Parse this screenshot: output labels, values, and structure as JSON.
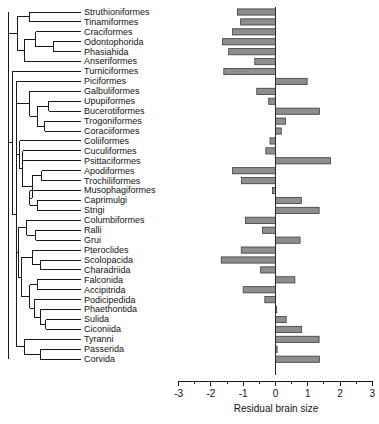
{
  "figure": {
    "kind": "phylogenetic-tree-with-bar-chart",
    "background": "#ffffff",
    "bar_fill": "#8e8e8e",
    "bar_stroke": "#3b3b3b",
    "branch_color": "#1a1a1a"
  },
  "chart_data": {
    "type": "bar",
    "orientation": "horizontal",
    "title": "",
    "xlabel": "Residual brain size",
    "ylabel": "",
    "xlim": [
      -3,
      3
    ],
    "xticks": [
      -3,
      -2,
      -1,
      0,
      1,
      2,
      3
    ],
    "xtick_labels": [
      "-3",
      "-2",
      "-1",
      "0",
      "1",
      "2",
      "3"
    ],
    "minor_ticks": true,
    "grid": false,
    "legend": null,
    "zero_reference_line": 0,
    "categories": [
      "Struthioniformes",
      "Tinamiformes",
      "Craciformes",
      "Odontophorida",
      "Phasiahida",
      "Anseriformes",
      "Turniciformes",
      "Piciformes",
      "Galbuliformes",
      "Upupiformes",
      "Bucerotiformes",
      "Trogoniformes",
      "Coraciiformes",
      "Coliiformes",
      "Cuculiformes",
      "Psittaciformes",
      "Apodiformes",
      "Trochiliformes",
      "Musophagiformes",
      "Caprimulgi",
      "Strigi",
      "Columbiformes",
      "Ralli",
      "Grui",
      "Pteroclides",
      "Scolopacida",
      "Charadriida",
      "Falconida",
      "Accipitrida",
      "Podicipedida",
      "Phaethontida",
      "Sulida",
      "Ciconiida",
      "Tyranni",
      "Passerida",
      "Corvida"
    ],
    "values": [
      -1.18,
      -1.08,
      -1.33,
      -1.64,
      -1.45,
      -0.64,
      -1.6,
      0.98,
      -0.58,
      -0.21,
      1.36,
      0.31,
      0.18,
      -0.17,
      -0.3,
      1.7,
      -1.33,
      -1.05,
      -0.09,
      0.8,
      -0.93,
      -0.4,
      0.76,
      -1.06,
      -1.68,
      -0.46,
      0.6,
      -1.0,
      -0.33,
      0.03,
      0.33,
      0.81,
      1.35,
      0.05,
      1.36,
      -1.3
    ],
    "n_taxa": 36
  },
  "taxa": [
    {
      "name": "Struthioniformes",
      "value": -1.18
    },
    {
      "name": "Tinamiformes",
      "value": -1.08
    },
    {
      "name": "Craciformes",
      "value": -1.33
    },
    {
      "name": "Odontophorida",
      "value": -1.64
    },
    {
      "name": "Phasiahida",
      "value": -1.45
    },
    {
      "name": "Anseriformes",
      "value": -0.64
    },
    {
      "name": "Turniciformes",
      "value": -1.6
    },
    {
      "name": "Piciformes",
      "value": 0.98
    },
    {
      "name": "Galbuliformes",
      "value": -0.58
    },
    {
      "name": "Upupiformes",
      "value": -0.21
    },
    {
      "name": "Bucerotiformes",
      "value": 1.36
    },
    {
      "name": "Trogoniformes",
      "value": 0.31
    },
    {
      "name": "Coraciiformes",
      "value": 0.18
    },
    {
      "name": "Coliiformes",
      "value": -0.17
    },
    {
      "name": "Cuculiformes",
      "value": -0.3
    },
    {
      "name": "Psittaciformes",
      "value": 1.7
    },
    {
      "name": "Apodiformes",
      "value": -1.33
    },
    {
      "name": "Trochiliformes",
      "value": -1.05
    },
    {
      "name": "Musophagiformes",
      "value": -0.09
    },
    {
      "name": "Caprimulgi",
      "value": 0.8
    },
    {
      "name": "Strigi",
      "value": 1.35
    },
    {
      "name": "Columbiformes",
      "value": -0.93
    },
    {
      "name": "Ralli",
      "value": -0.4
    },
    {
      "name": "Grui",
      "value": 0.76
    },
    {
      "name": "Pteroclides",
      "value": -1.06
    },
    {
      "name": "Scolopacida",
      "value": -1.68
    },
    {
      "name": "Charadriida",
      "value": -0.46
    },
    {
      "name": "Falconida",
      "value": 0.6
    },
    {
      "name": "Accipitrida",
      "value": -1.0
    },
    {
      "name": "Podicipedida",
      "value": -0.33
    },
    {
      "name": "Phaethontida",
      "value": 0.03
    },
    {
      "name": "Sulida",
      "value": 0.33
    },
    {
      "name": "Ciconiida",
      "value": 0.81
    },
    {
      "name": "Tyranni",
      "value": 1.35
    },
    {
      "name": "Passerida",
      "value": 0.05
    },
    {
      "name": "Corvida",
      "value": 1.36
    }
  ],
  "axis": {
    "label": "Residual brain size",
    "ticks": [
      "-3",
      "-2",
      "-1",
      "0",
      "1",
      "2",
      "3"
    ]
  }
}
